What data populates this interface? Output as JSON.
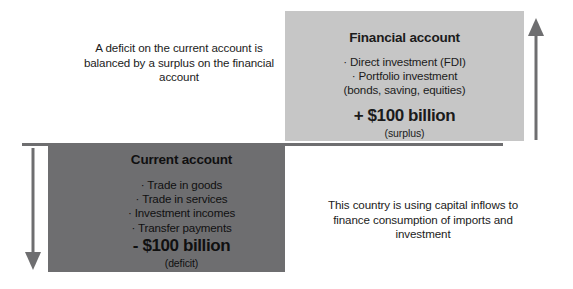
{
  "diagram": {
    "title_visible": false,
    "background_color": "#ffffff",
    "colors": {
      "financial_box": "#c6c6c6",
      "current_box": "#6e6e70",
      "divider_line": "#6e6e70",
      "arrow": "#6e6e70",
      "text": "#1b1b1b"
    }
  },
  "financial_account": {
    "title": "Financial account",
    "bullets": [
      "· Direct investment (FDI)",
      "· Portfolio investment"
    ],
    "sub_line": "(bonds, saving, equities)",
    "amount": "+ $100 billion",
    "amount_note": "(surplus)"
  },
  "current_account": {
    "title": "Current account",
    "bullets": [
      "· Trade in goods",
      "· Trade in services",
      "· Investment incomes",
      "· Transfer payments"
    ],
    "amount": "- $100 billion",
    "amount_note": "(deficit)"
  },
  "notes": {
    "left": "A deficit on the current account is balanced by a surplus on the financial account",
    "right": "This country is using capital inflows to finance consumption of imports and investment"
  },
  "arrows": {
    "up": {
      "icon": "arrow-up-icon",
      "direction": "up"
    },
    "down": {
      "icon": "arrow-down-icon",
      "direction": "down"
    }
  }
}
